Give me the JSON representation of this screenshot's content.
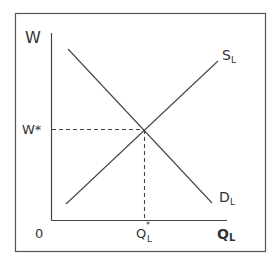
{
  "diagram": {
    "type": "labor-market-supply-demand",
    "y_axis_label": "W",
    "x_axis_label_main": "Q",
    "x_axis_label_sub": "L",
    "origin_label": "0",
    "equilibrium_wage_label": "W*",
    "equilibrium_quantity_label_main": "Q",
    "equilibrium_quantity_label_sup": "*",
    "equilibrium_quantity_label_sub": "L",
    "supply_label_main": "S",
    "supply_label_sub": "L",
    "demand_label_main": "D",
    "demand_label_sub": "L",
    "colors": {
      "line": "#444444",
      "frame": "#555555",
      "text": "#333333",
      "background": "#ffffff"
    }
  }
}
